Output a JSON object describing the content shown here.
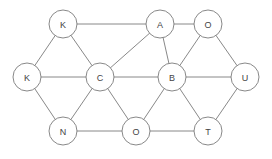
{
  "diagram": {
    "type": "graph",
    "node_radius": 14,
    "colors": {
      "stroke": "#7a7a7a",
      "label": "#444444",
      "fill": "#ffffff",
      "background": "#ffffff"
    },
    "nodes": [
      {
        "id": "n1",
        "label": "K",
        "x": 63,
        "y": 24
      },
      {
        "id": "n2",
        "label": "A",
        "x": 160,
        "y": 24
      },
      {
        "id": "n3",
        "label": "O",
        "x": 208,
        "y": 24
      },
      {
        "id": "n4",
        "label": "K",
        "x": 27,
        "y": 77
      },
      {
        "id": "n5",
        "label": "C",
        "x": 100,
        "y": 77
      },
      {
        "id": "n6",
        "label": "B",
        "x": 172,
        "y": 77
      },
      {
        "id": "n7",
        "label": "U",
        "x": 245,
        "y": 77
      },
      {
        "id": "n8",
        "label": "N",
        "x": 63,
        "y": 131
      },
      {
        "id": "n9",
        "label": "O",
        "x": 136,
        "y": 131
      },
      {
        "id": "n10",
        "label": "T",
        "x": 208,
        "y": 131
      }
    ],
    "edges": [
      [
        "n1",
        "n2"
      ],
      [
        "n2",
        "n3"
      ],
      [
        "n1",
        "n4"
      ],
      [
        "n1",
        "n5"
      ],
      [
        "n2",
        "n5"
      ],
      [
        "n2",
        "n6"
      ],
      [
        "n3",
        "n6"
      ],
      [
        "n3",
        "n7"
      ],
      [
        "n4",
        "n5"
      ],
      [
        "n5",
        "n6"
      ],
      [
        "n6",
        "n7"
      ],
      [
        "n4",
        "n8"
      ],
      [
        "n5",
        "n8"
      ],
      [
        "n5",
        "n9"
      ],
      [
        "n6",
        "n9"
      ],
      [
        "n6",
        "n10"
      ],
      [
        "n7",
        "n10"
      ],
      [
        "n8",
        "n9"
      ],
      [
        "n9",
        "n10"
      ]
    ]
  }
}
